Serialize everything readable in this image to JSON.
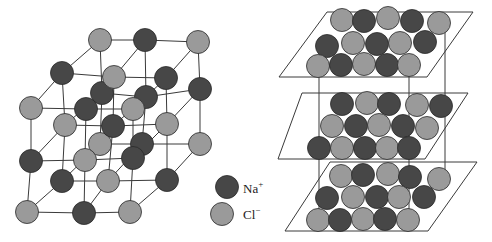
{
  "figure": {
    "colors": {
      "na": "#474747",
      "cl": "#9a9a9a",
      "outline": "#2a2a2a",
      "line": "#3a3a3a"
    },
    "atom_radius": 11.5
  },
  "legend": {
    "items": [
      {
        "ion": "na",
        "label": "Na",
        "charge": "+",
        "x": 227,
        "y": 187
      },
      {
        "ion": "cl",
        "label": "Cl",
        "charge": "−",
        "x": 222,
        "y": 214
      }
    ]
  },
  "lattice": {
    "grid": [
      [
        [
          {
            "x": 27,
            "y": 212,
            "ion": "cl"
          },
          {
            "x": 84,
            "y": 213,
            "ion": "na"
          },
          {
            "x": 130,
            "y": 212,
            "ion": "cl"
          }
        ],
        [
          {
            "x": 31,
            "y": 161,
            "ion": "na"
          },
          {
            "x": 85,
            "y": 160,
            "ion": "cl"
          },
          {
            "x": 133,
            "y": 158,
            "ion": "na"
          }
        ],
        [
          {
            "x": 31,
            "y": 108,
            "ion": "cl"
          },
          {
            "x": 86,
            "y": 109,
            "ion": "na"
          },
          {
            "x": 133,
            "y": 109,
            "ion": "cl"
          }
        ]
      ],
      [
        [
          {
            "x": 62,
            "y": 181,
            "ion": "na"
          },
          {
            "x": 108,
            "y": 181,
            "ion": "cl"
          },
          {
            "x": 167,
            "y": 180,
            "ion": "na"
          }
        ],
        [
          {
            "x": 65,
            "y": 125,
            "ion": "cl"
          },
          {
            "x": 113,
            "y": 126,
            "ion": "na"
          },
          {
            "x": 167,
            "y": 124,
            "ion": "cl"
          }
        ],
        [
          {
            "x": 62,
            "y": 73,
            "ion": "na"
          },
          {
            "x": 114,
            "y": 77,
            "ion": "cl"
          },
          {
            "x": 166,
            "y": 78,
            "ion": "na"
          }
        ]
      ],
      [
        [
          {
            "x": 100,
            "y": 144,
            "ion": "cl"
          },
          {
            "x": 142,
            "y": 144,
            "ion": "na"
          },
          {
            "x": 200,
            "y": 144,
            "ion": "cl"
          }
        ],
        [
          {
            "x": 102,
            "y": 93,
            "ion": "na"
          },
          {
            "x": 146,
            "y": 97,
            "ion": "na"
          },
          {
            "x": 200,
            "y": 89,
            "ion": "na"
          }
        ],
        [
          {
            "x": 100,
            "y": 40,
            "ion": "cl"
          },
          {
            "x": 145,
            "y": 40,
            "ion": "na"
          },
          {
            "x": 198,
            "y": 42,
            "ion": "cl"
          }
        ]
      ]
    ]
  },
  "planes": [
    {
      "name": "top",
      "outline": [
        [
          327,
          12
        ],
        [
          473,
          12
        ],
        [
          427,
          77
        ],
        [
          279,
          77
        ]
      ],
      "atoms": [
        {
          "x": 342,
          "y": 20,
          "ion": "cl"
        },
        {
          "x": 364,
          "y": 21,
          "ion": "na"
        },
        {
          "x": 388,
          "y": 18,
          "ion": "cl"
        },
        {
          "x": 412,
          "y": 21,
          "ion": "na"
        },
        {
          "x": 439,
          "y": 23,
          "ion": "cl"
        },
        {
          "x": 327,
          "y": 46,
          "ion": "na"
        },
        {
          "x": 353,
          "y": 43,
          "ion": "cl"
        },
        {
          "x": 377,
          "y": 44,
          "ion": "na"
        },
        {
          "x": 400,
          "y": 43,
          "ion": "cl"
        },
        {
          "x": 425,
          "y": 42,
          "ion": "na"
        },
        {
          "x": 318,
          "y": 66,
          "ion": "cl"
        },
        {
          "x": 341,
          "y": 65,
          "ion": "na"
        },
        {
          "x": 364,
          "y": 64,
          "ion": "cl"
        },
        {
          "x": 387,
          "y": 65,
          "ion": "na"
        },
        {
          "x": 409,
          "y": 65,
          "ion": "cl"
        }
      ]
    },
    {
      "name": "middle",
      "outline": [
        [
          302,
          93
        ],
        [
          468,
          93
        ],
        [
          425,
          159
        ],
        [
          278,
          159
        ]
      ],
      "atoms": [
        {
          "x": 342,
          "y": 104,
          "ion": "na"
        },
        {
          "x": 367,
          "y": 103,
          "ion": "cl"
        },
        {
          "x": 389,
          "y": 104,
          "ion": "na"
        },
        {
          "x": 417,
          "y": 105,
          "ion": "cl"
        },
        {
          "x": 441,
          "y": 106,
          "ion": "na"
        },
        {
          "x": 332,
          "y": 126,
          "ion": "cl"
        },
        {
          "x": 356,
          "y": 126,
          "ion": "na"
        },
        {
          "x": 379,
          "y": 125,
          "ion": "cl"
        },
        {
          "x": 403,
          "y": 126,
          "ion": "na"
        },
        {
          "x": 427,
          "y": 128,
          "ion": "cl"
        },
        {
          "x": 319,
          "y": 148,
          "ion": "na"
        },
        {
          "x": 342,
          "y": 148,
          "ion": "cl"
        },
        {
          "x": 365,
          "y": 148,
          "ion": "na"
        },
        {
          "x": 387,
          "y": 148,
          "ion": "cl"
        },
        {
          "x": 409,
          "y": 148,
          "ion": "na"
        }
      ]
    },
    {
      "name": "bottom",
      "outline": [
        [
          330,
          162
        ],
        [
          477,
          162
        ],
        [
          428,
          231
        ],
        [
          285,
          231
        ]
      ],
      "atoms": [
        {
          "x": 341,
          "y": 176,
          "ion": "cl"
        },
        {
          "x": 363,
          "y": 175,
          "ion": "na"
        },
        {
          "x": 388,
          "y": 174,
          "ion": "cl"
        },
        {
          "x": 410,
          "y": 177,
          "ion": "na"
        },
        {
          "x": 439,
          "y": 179,
          "ion": "cl"
        },
        {
          "x": 327,
          "y": 198,
          "ion": "na"
        },
        {
          "x": 353,
          "y": 197,
          "ion": "cl"
        },
        {
          "x": 377,
          "y": 197,
          "ion": "na"
        },
        {
          "x": 399,
          "y": 197,
          "ion": "cl"
        },
        {
          "x": 424,
          "y": 197,
          "ion": "na"
        },
        {
          "x": 318,
          "y": 220,
          "ion": "cl"
        },
        {
          "x": 340,
          "y": 220,
          "ion": "na"
        },
        {
          "x": 363,
          "y": 219,
          "ion": "cl"
        },
        {
          "x": 385,
          "y": 219,
          "ion": "na"
        },
        {
          "x": 408,
          "y": 220,
          "ion": "cl"
        }
      ]
    }
  ],
  "connectors": [
    {
      "x": 319,
      "y1": 77,
      "y2": 220
    },
    {
      "x": 409,
      "y1": 65,
      "y2": 220
    },
    {
      "x": 445,
      "y1": 23,
      "y2": 179
    }
  ]
}
